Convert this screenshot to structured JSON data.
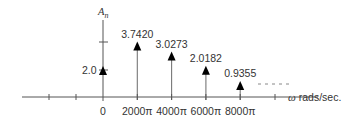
{
  "chart_data": {
    "type": "stem",
    "title": "",
    "ylabel": "A",
    "ylabel_subscript": "n",
    "xlabel_symbol": "ω",
    "xlabel_text": "rads/sec.",
    "categories": [
      "0",
      "2000π",
      "4000π",
      "6000π",
      "8000π"
    ],
    "values": [
      2.0,
      3.742,
      3.0273,
      2.0182,
      0.9355
    ],
    "value_labels": [
      "2.0",
      "3.7420",
      "3.0273",
      "2.0182",
      "0.9355"
    ],
    "x_numeric_rad_per_sec": [
      0,
      6283.19,
      12566.37,
      18849.56,
      25132.74
    ],
    "y_ticks": [
      2.0,
      4.0
    ],
    "y_tick_labels": [
      "2.0",
      ""
    ],
    "continuation": "dashed line indicating further harmonics",
    "grid": false,
    "legend": null
  },
  "colors": {
    "axis": "#555555",
    "stem": "#777777",
    "arrow": "#000000",
    "text": "#333333"
  }
}
